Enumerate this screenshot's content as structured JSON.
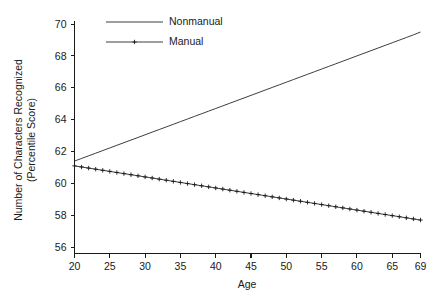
{
  "chart_data": {
    "type": "line",
    "title": "",
    "xlabel": "Age",
    "ylabel": "Number of Characters Recognized (Percentile Score)",
    "ylabel_line1": "Number of Characters Recognized",
    "ylabel_line2": "(Percentile Score)",
    "xlim": [
      20,
      69
    ],
    "ylim": [
      55.6,
      70.6
    ],
    "xticks": [
      20,
      25,
      30,
      35,
      40,
      45,
      50,
      55,
      60,
      65,
      69
    ],
    "xticklabels": [
      "20",
      "25",
      "30",
      "35",
      "40",
      "45",
      "50",
      "55",
      "60",
      "65",
      "69"
    ],
    "yticks": [
      56,
      58,
      60,
      62,
      64,
      66,
      68,
      70
    ],
    "yticklabels": [
      "56",
      "58",
      "60",
      "62",
      "64",
      "66",
      "68",
      "70"
    ],
    "grid": false,
    "legend_position": "top-left-inside",
    "x": [
      20,
      21,
      22,
      23,
      24,
      25,
      26,
      27,
      28,
      29,
      30,
      31,
      32,
      33,
      34,
      35,
      36,
      37,
      38,
      39,
      40,
      41,
      42,
      43,
      44,
      45,
      46,
      47,
      48,
      49,
      50,
      51,
      52,
      53,
      54,
      55,
      56,
      57,
      58,
      59,
      60,
      61,
      62,
      63,
      64,
      65,
      66,
      67,
      68,
      69
    ],
    "series": [
      {
        "name": "Nonmanual",
        "marker": "none",
        "values": [
          61.4,
          61.565,
          61.73,
          61.895,
          62.06,
          62.225,
          62.39,
          62.555,
          62.72,
          62.885,
          63.05,
          63.215,
          63.38,
          63.545,
          63.71,
          63.876,
          64.041,
          64.206,
          64.371,
          64.536,
          64.701,
          64.866,
          65.031,
          65.196,
          65.361,
          65.526,
          65.691,
          65.856,
          66.021,
          66.186,
          66.351,
          66.516,
          66.681,
          66.846,
          67.011,
          67.176,
          67.341,
          67.506,
          67.671,
          67.836,
          68.002,
          68.167,
          68.332,
          68.497,
          68.662,
          68.827,
          68.992,
          69.157,
          69.322,
          69.5
        ]
      },
      {
        "name": "Manual",
        "marker": "plus",
        "values": [
          61.1,
          61.031,
          60.961,
          60.892,
          60.822,
          60.753,
          60.684,
          60.614,
          60.545,
          60.476,
          60.406,
          60.337,
          60.267,
          60.198,
          60.129,
          60.059,
          59.99,
          59.92,
          59.851,
          59.782,
          59.712,
          59.643,
          59.573,
          59.504,
          59.435,
          59.365,
          59.296,
          59.227,
          59.157,
          59.088,
          59.018,
          58.949,
          58.88,
          58.81,
          58.741,
          58.671,
          58.602,
          58.533,
          58.463,
          58.394,
          58.324,
          58.255,
          58.186,
          58.116,
          58.047,
          57.978,
          57.908,
          57.839,
          57.769,
          57.7
        ]
      }
    ]
  },
  "legend": {
    "entries": [
      {
        "label": "Nonmanual"
      },
      {
        "label": "Manual"
      }
    ]
  },
  "colors": {
    "ink": "#1a1a1a",
    "background": "#ffffff"
  }
}
